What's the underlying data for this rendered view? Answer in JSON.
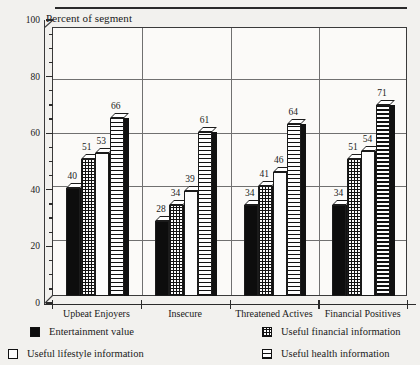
{
  "chart_data": {
    "type": "bar",
    "title": "",
    "ylabel": "Percent of segment",
    "xlabel": "",
    "ylim": [
      0,
      100
    ],
    "yticks": [
      0,
      20,
      40,
      60,
      80,
      100
    ],
    "ytick_labels": [
      "0",
      "20",
      "40",
      "60",
      "80",
      "100"
    ],
    "minor_tick_step": 5,
    "grid": "horizontal gridlines at 20, 40, 60, 80 plus vertical group separators",
    "legend_position": "below plot, two columns",
    "categories": [
      "Upbeat Enjoyers",
      "Insecure",
      "Threatened Actives",
      "Financial Positives"
    ],
    "series": [
      {
        "name": "Entertainment value",
        "pattern": "solid-black",
        "values": [
          40,
          28,
          34,
          34
        ]
      },
      {
        "name": "Useful financial information",
        "pattern": "grid",
        "values": [
          51,
          34,
          41,
          51
        ]
      },
      {
        "name": "Useful lifestyle information",
        "pattern": "dots",
        "values": [
          53,
          39,
          46,
          54
        ]
      },
      {
        "name": "Useful health information",
        "pattern": "h-lines",
        "values": [
          66,
          61,
          64,
          71
        ]
      }
    ]
  },
  "axis": {
    "caption": "Percent of segment"
  },
  "legend": {
    "items": [
      {
        "label": "Entertainment value",
        "swatch": "solid-swatch"
      },
      {
        "label": "Useful financial information",
        "swatch": "grid-swatch"
      },
      {
        "label": "Useful lifestyle information",
        "swatch": "dots-swatch"
      },
      {
        "label": "Useful health information",
        "swatch": "hlines-swatch"
      }
    ]
  }
}
